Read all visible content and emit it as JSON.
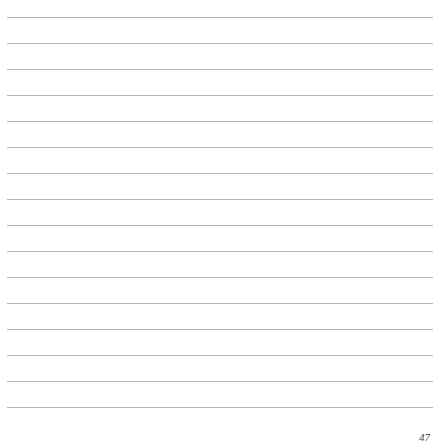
{
  "page": {
    "page_number": "47",
    "ruled_lines": 16,
    "line_color": "#b4b4b4",
    "first_line_y": 17,
    "line_spacing": 26
  }
}
